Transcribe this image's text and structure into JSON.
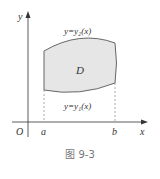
{
  "figure": {
    "caption": "图 9-3",
    "axes": {
      "x_label": "x",
      "y_label": "y",
      "origin_label": "O"
    },
    "ticks": {
      "a_label": "a",
      "b_label": "b"
    },
    "region": {
      "label": "D",
      "fill_color": "#e6e6e6",
      "edge_color": "#666666"
    },
    "curves": {
      "upper_label": "y=y₂(x)",
      "lower_label": "y=y₁(x)"
    }
  }
}
